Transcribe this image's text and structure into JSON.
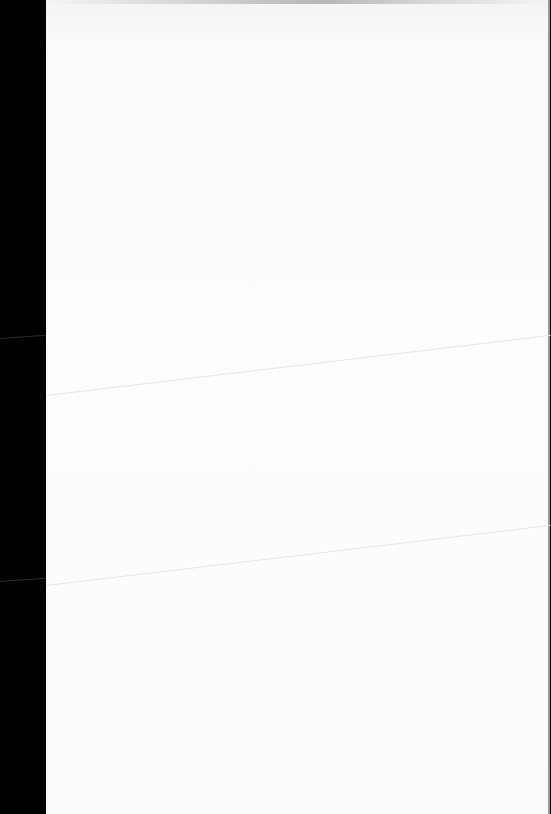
{
  "document": {
    "page": {
      "content": "",
      "background": "#fcfcfc",
      "left_margin_color": "#000000",
      "edge_color": "#9a9a9a"
    }
  }
}
